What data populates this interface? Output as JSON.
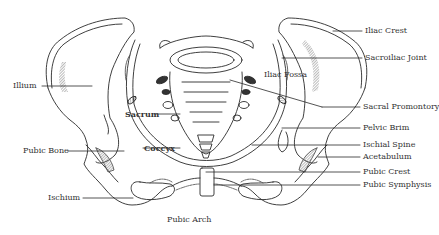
{
  "diagram": {
    "labels": {
      "iliac_crest": "Iliac Crest",
      "sacroiliac_joint": "Sacroiliac Joint",
      "iliac_fossa": "Iliac Fossa",
      "sacral_promontory": "Sacral Promontory",
      "pelvic_brim": "Pelvic Brim",
      "ischial_spine": "Ischial Spine",
      "acetabulum": "Acetabulum",
      "pubic_crest": "Pubic Crest",
      "pubic_symphysis": "Pubic Symphysis",
      "illium": "Illium",
      "pubic_bone": "Pubic Bone",
      "ischium": "Ischium",
      "sacrum": "Sacrum",
      "coccyx": "Coccyx",
      "pubic_arch": "Pubic Arch"
    },
    "colors": {
      "line": "#2a2a2a",
      "hatch": "#555555",
      "text": "#333333",
      "background": "#ffffff"
    }
  }
}
